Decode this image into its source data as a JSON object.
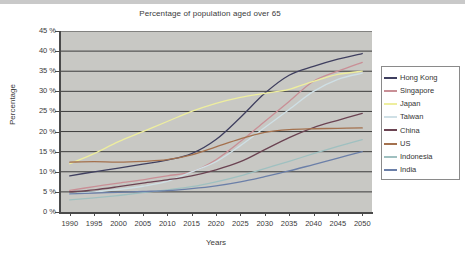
{
  "chart_data": {
    "type": "line",
    "title": "Percentage of population aged over 65",
    "xlabel": "Years",
    "ylabel": "Percentage",
    "xlim": [
      1988,
      2052
    ],
    "ylim": [
      0,
      45
    ],
    "grid": "horizontal",
    "legend_position": "right-outside",
    "plot_background": "#c8c8c4",
    "x": [
      1990,
      1995,
      2000,
      2005,
      2010,
      2015,
      2020,
      2025,
      2030,
      2035,
      2040,
      2045,
      2050
    ],
    "xtick_labels": [
      "1990",
      "1995",
      "2000",
      "2005",
      "2010",
      "2015",
      "2020",
      "2025",
      "2030",
      "2035",
      "2040",
      "2045",
      "2050"
    ],
    "ytick_labels": [
      "0 %",
      "5 %",
      "10 %",
      "15 %",
      "20 %",
      "25 %",
      "30 %",
      "35 %",
      "40 %",
      "45 %"
    ],
    "ytick_values": [
      0,
      5,
      10,
      15,
      20,
      25,
      30,
      35,
      40,
      45
    ],
    "series": [
      {
        "name": "Hong Kong",
        "color": "#3f3f5f",
        "values": [
          9.0,
          10.0,
          10.9,
          11.9,
          12.9,
          14.5,
          18.0,
          23.5,
          29.5,
          34.0,
          36.2,
          38.0,
          39.4
        ]
      },
      {
        "name": "Singapore",
        "color": "#c98f96",
        "values": [
          5.4,
          6.3,
          7.2,
          8.0,
          9.0,
          10.0,
          13.0,
          17.5,
          22.5,
          27.5,
          32.5,
          35.0,
          37.2
        ]
      },
      {
        "name": "Japan",
        "color": "#eeee9e",
        "values": [
          12.0,
          14.5,
          17.5,
          20.0,
          22.5,
          25.0,
          27.0,
          28.5,
          29.5,
          30.5,
          32.5,
          34.2,
          35.0
        ]
      },
      {
        "name": "Taiwan",
        "color": "#cfe0e6",
        "values": [
          4.5,
          5.0,
          5.6,
          6.4,
          7.6,
          10.0,
          12.5,
          16.5,
          21.0,
          25.5,
          30.0,
          33.0,
          34.5
        ]
      },
      {
        "name": "China",
        "color": "#6b4352",
        "values": [
          5.0,
          5.5,
          6.3,
          7.2,
          8.0,
          9.0,
          10.5,
          12.5,
          15.5,
          18.5,
          21.0,
          22.8,
          24.5
        ]
      },
      {
        "name": "US",
        "color": "#a4714e",
        "values": [
          12.4,
          12.5,
          12.4,
          12.6,
          13.0,
          14.2,
          16.2,
          18.2,
          19.8,
          20.5,
          20.7,
          20.8,
          20.9
        ]
      },
      {
        "name": "Indonesia",
        "color": "#9fc0c0",
        "values": [
          3.0,
          3.5,
          4.1,
          4.8,
          5.5,
          6.3,
          7.5,
          9.0,
          10.8,
          12.6,
          14.5,
          16.3,
          18.0
        ]
      },
      {
        "name": "India",
        "color": "#6b7fa8",
        "values": [
          4.5,
          4.7,
          4.9,
          5.1,
          5.3,
          5.8,
          6.5,
          7.5,
          8.8,
          10.2,
          11.8,
          13.4,
          15.0
        ]
      }
    ]
  },
  "legend": {
    "entries": [
      {
        "label": "Hong Kong"
      },
      {
        "label": "Singapore"
      },
      {
        "label": "Japan"
      },
      {
        "label": "Taiwan"
      },
      {
        "label": "China"
      },
      {
        "label": "US"
      },
      {
        "label": "Indonesia"
      },
      {
        "label": "India"
      }
    ]
  }
}
